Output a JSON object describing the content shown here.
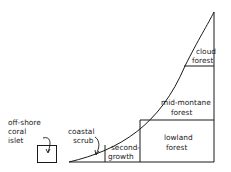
{
  "diagram": {
    "zones": {
      "cloud_forest": [
        "cloud",
        "forest"
      ],
      "mid_montane_forest": [
        "mid-montane",
        "forest"
      ],
      "lowland_forest": [
        "lowland",
        "forest"
      ],
      "second_growth": [
        "second-",
        "growth"
      ],
      "coastal_scrub": [
        "coastal",
        "scrub"
      ],
      "offshore_islet": [
        "off-shore",
        "coral",
        "islet"
      ]
    },
    "colors": {
      "line": "#1a1a1a",
      "background": "#ffffff"
    }
  }
}
